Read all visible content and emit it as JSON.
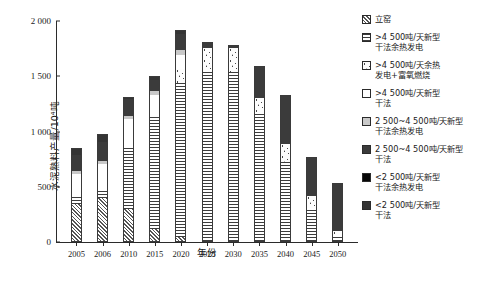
{
  "chart_data": {
    "type": "bar",
    "title": "",
    "xlabel": "年份",
    "ylabel": "水泥熟料产量/10⁴吨",
    "ylim": [
      0,
      2000
    ],
    "yticks": [
      0,
      500,
      1000,
      1500,
      2000
    ],
    "ytick_labels": [
      "0",
      "500",
      "1 000",
      "1 500",
      "2 000"
    ],
    "grid": false,
    "legend_position": "right",
    "stacked": true,
    "categories": [
      "2005",
      "2006",
      "2010",
      "2015",
      "2020",
      "2025",
      "2030",
      "2035",
      "2040",
      "2045",
      "2050"
    ],
    "series": [
      {
        "name": "立窑",
        "key": "shaft-kiln",
        "pattern": "diagonal-hatch",
        "values": [
          345,
          400,
          300,
          120,
          45,
          0,
          0,
          0,
          0,
          0,
          0
        ]
      },
      {
        "name": ">4 500吨/天新型干法余热发电",
        "key": "gt4500-dry-waste-heat-power",
        "pattern": "horizontal-lines",
        "values": [
          60,
          70,
          560,
          1020,
          1390,
          1560,
          1540,
          1170,
          720,
          310,
          60
        ]
      },
      {
        "name": ">4 500吨/天余热发电+富氧燃烧",
        "key": "gt4500-waste-heat-oxygen-combustion",
        "pattern": "speckled",
        "values": [
          0,
          0,
          0,
          0,
          130,
          200,
          215,
          135,
          165,
          110,
          40
        ]
      },
      {
        "name": ">4 500吨/天新型干法",
        "key": "gt4500-new-dry",
        "pattern": "white",
        "values": [
          215,
          240,
          250,
          190,
          125,
          0,
          0,
          0,
          0,
          0,
          0
        ]
      },
      {
        "name": "2 500~4 500吨/天新型干法余热发电",
        "key": "2500-4500-dry-waste-heat-power",
        "pattern": "light-gray",
        "values": [
          20,
          25,
          30,
          35,
          50,
          0,
          0,
          0,
          0,
          0,
          0
        ]
      },
      {
        "name": "2 500~4 500吨/天新型干法",
        "key": "2500-4500-new-dry",
        "pattern": "dark-gray",
        "values": [
          150,
          170,
          150,
          100,
          145,
          50,
          25,
          290,
          450,
          350,
          430
        ]
      },
      {
        "name": "<2 500吨/天新型干法余热发电",
        "key": "lt2500-dry-waste-heat-power",
        "pattern": "black",
        "values": [
          0,
          0,
          0,
          0,
          0,
          0,
          0,
          0,
          0,
          0,
          0
        ]
      },
      {
        "name": "<2 500吨/天新型干法",
        "key": "lt2500-new-dry",
        "pattern": "dark-gray-2",
        "values": [
          60,
          70,
          25,
          35,
          35,
          0,
          0,
          0,
          0,
          0,
          0
        ]
      }
    ],
    "totals": [
      850,
      975,
      1315,
      1500,
      1920,
      1810,
      1780,
      1595,
      1335,
      770,
      530
    ]
  },
  "legend": {
    "items": [
      {
        "label": "立窑",
        "swatch": "diagonal-hatch"
      },
      {
        "label": ">4 500吨/天新型\n干法余热发电",
        "swatch": "horizontal-lines"
      },
      {
        "label": ">4 500吨/天余热\n发电+富氧燃烧",
        "swatch": "speckled"
      },
      {
        "label": ">4 500吨/天新型\n干法",
        "swatch": "white"
      },
      {
        "label": "2 500~4 500吨/天新型\n干法余热发电",
        "swatch": "light-gray"
      },
      {
        "label": "2 500~4 500吨/天新型\n干法",
        "swatch": "dark-gray"
      },
      {
        "label": "<2 500吨/天新型\n干法余热发电",
        "swatch": "black"
      },
      {
        "label": "<2 500吨/天新型\n干法",
        "swatch": "dark-gray-2"
      }
    ]
  },
  "colors": {
    "axis": "#2b2b2b",
    "text": "#1a1a1a",
    "background": "#ffffff"
  }
}
